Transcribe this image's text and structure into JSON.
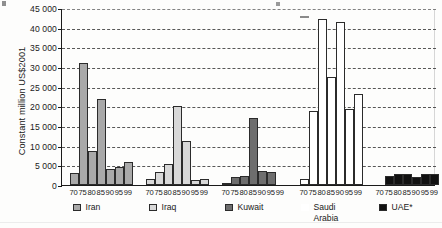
{
  "chart_data": {
    "type": "bar",
    "title": "",
    "subtitle": "",
    "xlabel": "",
    "ylabel": "Constant million US$2001",
    "ylim": [
      0,
      45000
    ],
    "ytick_values": [
      0,
      5000,
      10000,
      15000,
      20000,
      25000,
      30000,
      35000,
      40000,
      45000
    ],
    "ytick_labels": [
      "0",
      "5 000",
      "10 000",
      "15 000",
      "20 000",
      "25 000",
      "30 000",
      "35 000",
      "40 000",
      "45 000"
    ],
    "grid": "horizontal-dashed",
    "legend_position": "bottom",
    "categories": [
      "70",
      "75",
      "80",
      "85",
      "90",
      "95",
      "99"
    ],
    "series": [
      {
        "name": "Iran",
        "color": "#a9a9a9",
        "values": [
          3000,
          31000,
          8700,
          21900,
          4100,
          4700,
          5900
        ]
      },
      {
        "name": "Iraq",
        "color": "#d8d8d8",
        "values": [
          1600,
          3400,
          5400,
          20000,
          11200,
          1300,
          1500
        ]
      },
      {
        "name": "Kuwait",
        "color": "#6e6e6e",
        "values": [
          550,
          2000,
          2400,
          17000,
          3600,
          3200,
          0
        ]
      },
      {
        "name": "Saudi\nArabia",
        "color": "#ffffff",
        "values": [
          1500,
          18900,
          42300,
          27400,
          41500,
          19300,
          23100
        ]
      },
      {
        "name": "UAE*",
        "color": "#111111",
        "values": [
          0,
          2200,
          2900,
          2900,
          2000,
          2900,
          2900
        ]
      }
    ]
  },
  "axis": {
    "y_label": "Constant million US$2001"
  },
  "legend": {
    "items": [
      {
        "label": "Iran",
        "swatch": "#a9a9a9"
      },
      {
        "label": "Iraq",
        "swatch": "#d8d8d8"
      },
      {
        "label": "Kuwait",
        "swatch": "#6e6e6e"
      },
      {
        "label": "Saudi\nArabia",
        "swatch": "#ffffff"
      },
      {
        "label": "UAE*",
        "swatch": "#111111"
      }
    ]
  }
}
